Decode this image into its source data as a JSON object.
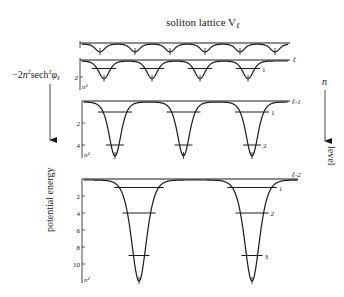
{
  "title": "soliton lattice V",
  "title_subscript": "ℓ",
  "left_formula": {
    "prefix": "−2",
    "n": "n",
    "sup2": "2",
    "sech": "sech",
    "phi": "φ",
    "sub": "ℓ"
  },
  "left_axis_label": "potential energy",
  "right_axis_symbol": "n",
  "right_axis_label": "level",
  "panels": [
    {
      "id": "top",
      "label": "",
      "wells": 6,
      "depth_n2": 0.5,
      "ticks": [],
      "levels": []
    },
    {
      "id": "l",
      "label": "ℓ",
      "wells": 4,
      "depth_n2": 2.2,
      "ticks": [
        "2"
      ],
      "axis_unit": "n²",
      "levels": [
        {
          "n": 1,
          "label": "1",
          "energy_n2": 1
        }
      ]
    },
    {
      "id": "l-1",
      "label": "ℓ-1",
      "wells": 3,
      "depth_n2": 5,
      "ticks": [
        "2",
        "4"
      ],
      "axis_unit": "n²",
      "levels": [
        {
          "n": 1,
          "label": "1",
          "energy_n2": 1
        },
        {
          "n": 2,
          "label": "2",
          "energy_n2": 4
        }
      ]
    },
    {
      "id": "l-2",
      "label": "ℓ-2",
      "wells": 2,
      "depth_n2": 12,
      "ticks": [
        "2",
        "4",
        "6",
        "8",
        "10"
      ],
      "axis_unit": "n²",
      "levels": [
        {
          "n": 1,
          "label": "1",
          "energy_n2": 1
        },
        {
          "n": 2,
          "label": "2",
          "energy_n2": 4
        },
        {
          "n": 3,
          "label": "3",
          "energy_n2": 9
        }
      ]
    }
  ]
}
